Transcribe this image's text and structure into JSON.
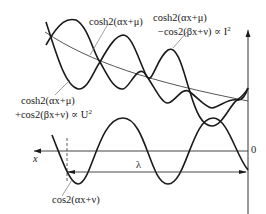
{
  "labels": {
    "top_envelope": "cosh2(αx+μ)",
    "difference_1": "cosh2(αx+μ)",
    "difference_2": "−cos2(βx+ν) ∝ I",
    "difference_exp": "2",
    "sum_1": "cosh2(αx+μ)",
    "sum_2": "+cos2(βx+ν)  ∝ U",
    "sum_exp": "2",
    "bottom_wave": "cos2(αx+ν)",
    "x_axis": "x",
    "origin": "0",
    "wavelength": "λ"
  },
  "colors": {
    "curve": "#1a1a1a",
    "thin": "#555555",
    "background": "#ffffff"
  }
}
